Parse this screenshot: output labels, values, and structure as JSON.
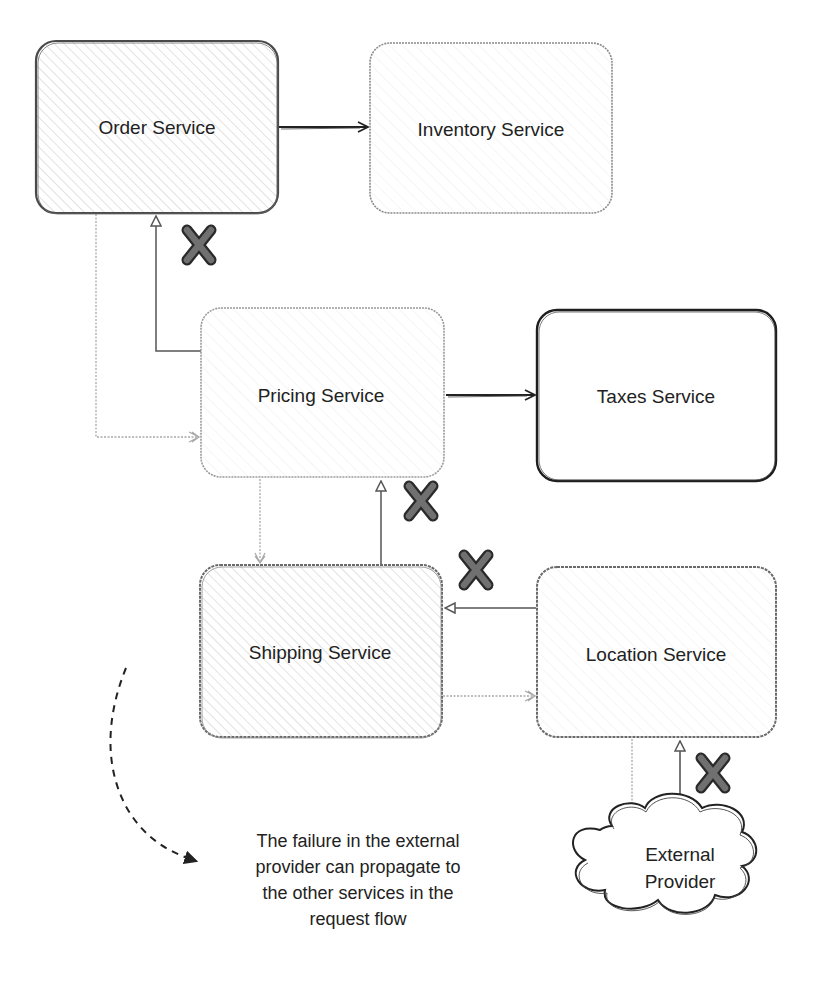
{
  "diagram": {
    "colors": {
      "stroke_dark": "#222222",
      "stroke_light": "#8a8a8a",
      "hatch": "#c8c8c8",
      "x_mark_fill": "#6e6e6e",
      "x_mark_outline": "#2a2a2a",
      "text": "#222222"
    },
    "nodes": [
      {
        "id": "order",
        "label": "Order Service",
        "shape": "hatched-box",
        "border": "dark"
      },
      {
        "id": "inventory",
        "label": "Inventory Service",
        "shape": "hatched-box",
        "border": "light"
      },
      {
        "id": "pricing",
        "label": "Pricing Service",
        "shape": "hatched-box",
        "border": "light"
      },
      {
        "id": "taxes",
        "label": "Taxes Service",
        "shape": "box",
        "border": "dark"
      },
      {
        "id": "shipping",
        "label": "Shipping Service",
        "shape": "hatched-box",
        "border": "dark"
      },
      {
        "id": "location",
        "label": "Location Service",
        "shape": "hatched-box",
        "border": "dark"
      },
      {
        "id": "external",
        "label_lines": [
          "External",
          "Provider"
        ],
        "shape": "cloud",
        "border": "dark"
      }
    ],
    "edges": [
      {
        "from": "order",
        "to": "inventory",
        "style": "solid-dark"
      },
      {
        "from": "order",
        "to": "pricing",
        "style": "dotted-light",
        "kind": "request"
      },
      {
        "from": "pricing",
        "to": "order",
        "style": "solid-medium",
        "kind": "response",
        "failed": true
      },
      {
        "from": "pricing",
        "to": "taxes",
        "style": "solid-dark"
      },
      {
        "from": "pricing",
        "to": "shipping",
        "style": "dotted-light",
        "kind": "request"
      },
      {
        "from": "shipping",
        "to": "pricing",
        "style": "solid-medium",
        "kind": "response",
        "failed": true
      },
      {
        "from": "shipping",
        "to": "location",
        "style": "dotted-light",
        "kind": "request"
      },
      {
        "from": "location",
        "to": "shipping",
        "style": "solid-medium",
        "kind": "response",
        "failed": true
      },
      {
        "from": "location",
        "to": "external",
        "style": "dotted-light",
        "kind": "request"
      },
      {
        "from": "external",
        "to": "location",
        "style": "solid-medium",
        "kind": "response",
        "failed": true
      }
    ],
    "failure_marks": [
      {
        "edge": "pricing-to-order",
        "icon": "x-mark-icon"
      },
      {
        "edge": "shipping-to-pricing",
        "icon": "x-mark-icon"
      },
      {
        "edge": "location-to-shipping",
        "icon": "x-mark-icon"
      },
      {
        "edge": "external-to-location",
        "icon": "x-mark-icon"
      }
    ],
    "annotation": {
      "lines": [
        "The failure in the external",
        "provider can propagate to",
        "the other services in the",
        "request flow"
      ],
      "arrow_style": "dashed-curved"
    }
  }
}
